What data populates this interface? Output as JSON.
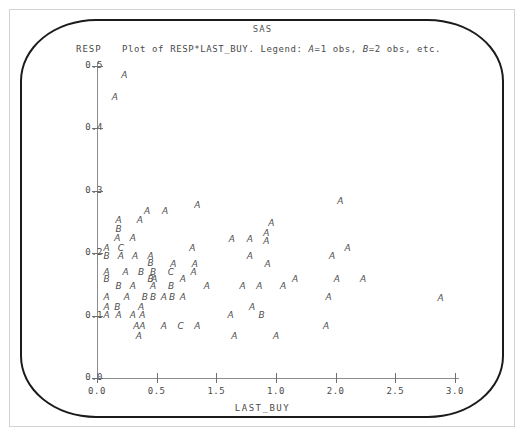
{
  "window": {
    "title": "SAS"
  },
  "header": {
    "y_axis_name": "RESP",
    "legend_prefix": "Plot of RESP*LAST_BUY. Legend: ",
    "legend_a_symbol": "A",
    "legend_a_text": "=1 obs, ",
    "legend_b_symbol": "B",
    "legend_b_text": "=2 obs, etc."
  },
  "axes": {
    "x_label": "LAST_BUY",
    "y_label": "RESP",
    "y_ticks": [
      "0.5",
      "0.4",
      "0.3",
      "0.2",
      "0.1",
      "0.0"
    ],
    "x_ticks": [
      "0.0",
      "0.5",
      "1.5",
      "1.0",
      "2.0",
      "2.5",
      "3.0"
    ]
  },
  "chart_data": {
    "type": "scatter",
    "title": "SAS",
    "subtitle": "Plot of RESP*LAST_BUY. Legend: A=1 obs, B=2 obs, etc.",
    "xlabel": "LAST_BUY",
    "ylabel": "RESP",
    "xlim": [
      0.0,
      3.0
    ],
    "ylim": [
      0.0,
      0.5
    ],
    "grid": false,
    "legend": {
      "position": "top",
      "entries": [
        {
          "symbol": "A",
          "meaning": "1 obs"
        },
        {
          "symbol": "B",
          "meaning": "2 obs"
        },
        {
          "symbol": "C",
          "meaning": "3 obs"
        }
      ]
    },
    "x_tick_values": [
      0.0,
      0.5,
      1.5,
      1.0,
      2.0,
      2.5,
      3.0
    ],
    "y_tick_values": [
      0.5,
      0.4,
      0.3,
      0.2,
      0.1,
      0.0
    ],
    "points": [
      {
        "x": 0.23,
        "y": 0.485,
        "symbol": "A"
      },
      {
        "x": 0.15,
        "y": 0.45,
        "symbol": "A"
      },
      {
        "x": 2.04,
        "y": 0.283,
        "symbol": "A"
      },
      {
        "x": 0.84,
        "y": 0.277,
        "symbol": "A"
      },
      {
        "x": 0.42,
        "y": 0.267,
        "symbol": "A"
      },
      {
        "x": 0.57,
        "y": 0.267,
        "symbol": "A"
      },
      {
        "x": 0.18,
        "y": 0.253,
        "symbol": "A"
      },
      {
        "x": 0.36,
        "y": 0.253,
        "symbol": "A"
      },
      {
        "x": 1.46,
        "y": 0.248,
        "symbol": "A"
      },
      {
        "x": 0.18,
        "y": 0.238,
        "symbol": "B"
      },
      {
        "x": 1.42,
        "y": 0.233,
        "symbol": "A"
      },
      {
        "x": 0.17,
        "y": 0.224,
        "symbol": "A"
      },
      {
        "x": 0.3,
        "y": 0.224,
        "symbol": "A"
      },
      {
        "x": 1.13,
        "y": 0.222,
        "symbol": "A"
      },
      {
        "x": 1.28,
        "y": 0.222,
        "symbol": "A"
      },
      {
        "x": 1.42,
        "y": 0.219,
        "symbol": "A"
      },
      {
        "x": 0.08,
        "y": 0.208,
        "symbol": "A"
      },
      {
        "x": 0.2,
        "y": 0.208,
        "symbol": "C"
      },
      {
        "x": 0.8,
        "y": 0.208,
        "symbol": "A"
      },
      {
        "x": 2.1,
        "y": 0.208,
        "symbol": "A"
      },
      {
        "x": 0.08,
        "y": 0.196,
        "symbol": "B"
      },
      {
        "x": 0.2,
        "y": 0.196,
        "symbol": "A"
      },
      {
        "x": 0.32,
        "y": 0.196,
        "symbol": "A"
      },
      {
        "x": 0.45,
        "y": 0.196,
        "symbol": "A"
      },
      {
        "x": 1.28,
        "y": 0.196,
        "symbol": "A"
      },
      {
        "x": 1.97,
        "y": 0.196,
        "symbol": "A"
      },
      {
        "x": 0.45,
        "y": 0.185,
        "symbol": "B"
      },
      {
        "x": 0.64,
        "y": 0.182,
        "symbol": "A"
      },
      {
        "x": 0.82,
        "y": 0.182,
        "symbol": "A"
      },
      {
        "x": 1.43,
        "y": 0.182,
        "symbol": "A"
      },
      {
        "x": 0.08,
        "y": 0.17,
        "symbol": "A"
      },
      {
        "x": 0.24,
        "y": 0.17,
        "symbol": "A"
      },
      {
        "x": 0.37,
        "y": 0.17,
        "symbol": "B"
      },
      {
        "x": 0.47,
        "y": 0.17,
        "symbol": "B"
      },
      {
        "x": 0.62,
        "y": 0.17,
        "symbol": "C"
      },
      {
        "x": 0.81,
        "y": 0.17,
        "symbol": "A"
      },
      {
        "x": 0.08,
        "y": 0.158,
        "symbol": "B"
      },
      {
        "x": 0.45,
        "y": 0.158,
        "symbol": "B"
      },
      {
        "x": 0.48,
        "y": 0.158,
        "symbol": "A"
      },
      {
        "x": 0.72,
        "y": 0.158,
        "symbol": "A"
      },
      {
        "x": 1.66,
        "y": 0.158,
        "symbol": "A"
      },
      {
        "x": 2.01,
        "y": 0.158,
        "symbol": "A"
      },
      {
        "x": 2.23,
        "y": 0.158,
        "symbol": "A"
      },
      {
        "x": 0.18,
        "y": 0.148,
        "symbol": "B"
      },
      {
        "x": 0.3,
        "y": 0.148,
        "symbol": "A"
      },
      {
        "x": 0.47,
        "y": 0.148,
        "symbol": "A"
      },
      {
        "x": 0.62,
        "y": 0.148,
        "symbol": "B"
      },
      {
        "x": 0.92,
        "y": 0.148,
        "symbol": "A"
      },
      {
        "x": 1.22,
        "y": 0.148,
        "symbol": "A"
      },
      {
        "x": 1.36,
        "y": 0.148,
        "symbol": "A"
      },
      {
        "x": 1.56,
        "y": 0.148,
        "symbol": "A"
      },
      {
        "x": 0.08,
        "y": 0.13,
        "symbol": "A"
      },
      {
        "x": 0.25,
        "y": 0.13,
        "symbol": "A"
      },
      {
        "x": 0.4,
        "y": 0.13,
        "symbol": "B"
      },
      {
        "x": 0.47,
        "y": 0.13,
        "symbol": "B"
      },
      {
        "x": 0.56,
        "y": 0.13,
        "symbol": "A"
      },
      {
        "x": 0.63,
        "y": 0.13,
        "symbol": "B"
      },
      {
        "x": 0.72,
        "y": 0.13,
        "symbol": "A"
      },
      {
        "x": 1.94,
        "y": 0.13,
        "symbol": "A"
      },
      {
        "x": 2.88,
        "y": 0.128,
        "symbol": "A"
      },
      {
        "x": 0.08,
        "y": 0.113,
        "symbol": "A"
      },
      {
        "x": 0.17,
        "y": 0.113,
        "symbol": "B"
      },
      {
        "x": 0.37,
        "y": 0.113,
        "symbol": "A"
      },
      {
        "x": 1.3,
        "y": 0.113,
        "symbol": "A"
      },
      {
        "x": 0.08,
        "y": 0.101,
        "symbol": "A"
      },
      {
        "x": 0.18,
        "y": 0.101,
        "symbol": "A"
      },
      {
        "x": 0.3,
        "y": 0.101,
        "symbol": "A"
      },
      {
        "x": 0.38,
        "y": 0.101,
        "symbol": "A"
      },
      {
        "x": 1.12,
        "y": 0.101,
        "symbol": "A"
      },
      {
        "x": 1.38,
        "y": 0.101,
        "symbol": "B"
      },
      {
        "x": 0.33,
        "y": 0.083,
        "symbol": "A"
      },
      {
        "x": 0.38,
        "y": 0.083,
        "symbol": "A"
      },
      {
        "x": 0.56,
        "y": 0.083,
        "symbol": "A"
      },
      {
        "x": 0.7,
        "y": 0.083,
        "symbol": "C"
      },
      {
        "x": 0.84,
        "y": 0.083,
        "symbol": "A"
      },
      {
        "x": 1.92,
        "y": 0.083,
        "symbol": "A"
      },
      {
        "x": 0.35,
        "y": 0.068,
        "symbol": "A"
      },
      {
        "x": 1.15,
        "y": 0.068,
        "symbol": "A"
      },
      {
        "x": 1.5,
        "y": 0.068,
        "symbol": "A"
      }
    ]
  }
}
